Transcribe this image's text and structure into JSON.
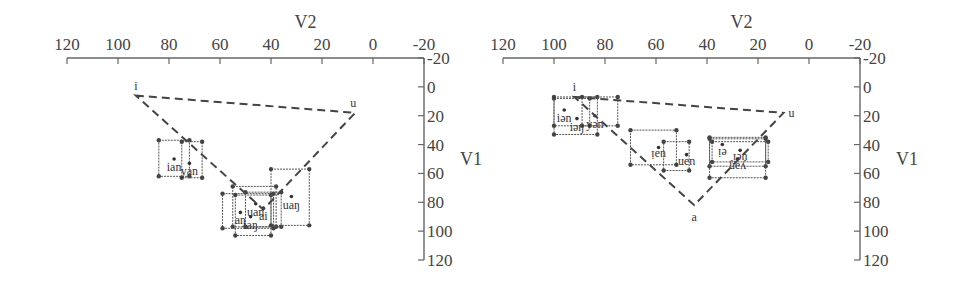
{
  "chart_data": [
    {
      "type": "scatter",
      "title": "",
      "xlabel": "V2",
      "ylabel": "V1",
      "xlim": [
        120,
        -20
      ],
      "ylim": [
        -20,
        120
      ],
      "x_ticks": [
        "120",
        "100",
        "80",
        "60",
        "40",
        "20",
        "0",
        "-20"
      ],
      "y_ticks": [
        "-20",
        "0",
        "20",
        "40",
        "60",
        "80",
        "100",
        "120"
      ],
      "grid": false,
      "triangle": {
        "points": [
          {
            "label": "i",
            "x": 93,
            "y": 6
          },
          {
            "label": "u",
            "x": 7,
            "y": 18
          },
          {
            "label": "",
            "x": 43,
            "y": 85
          }
        ]
      },
      "boxes": [
        {
          "label": "ian",
          "x": [
            84,
            72
          ],
          "y": [
            37,
            62
          ],
          "cx": 78,
          "cy": 50
        },
        {
          "label": "yan",
          "x": [
            75,
            67
          ],
          "y": [
            38,
            63
          ],
          "cx": 72,
          "cy": 53
        },
        {
          "label": "uan",
          "x": [
            55,
            38
          ],
          "y": [
            69,
            97
          ],
          "cx": 46,
          "cy": 81
        },
        {
          "label": "aŋ",
          "x": [
            59,
            39
          ],
          "y": [
            74,
            98
          ],
          "cx": 52,
          "cy": 87
        },
        {
          "label": "iaŋ",
          "x": [
            54,
            40
          ],
          "y": [
            75,
            103
          ],
          "cx": 48,
          "cy": 90
        },
        {
          "label": "ai",
          "x": [
            50,
            36
          ],
          "y": [
            73,
            97
          ],
          "cx": 43,
          "cy": 84
        },
        {
          "label": "uaŋ",
          "x": [
            40,
            25
          ],
          "y": [
            57,
            96
          ],
          "cx": 32,
          "cy": 76
        }
      ]
    },
    {
      "type": "scatter",
      "title": "",
      "xlabel": "V2",
      "ylabel": "V1",
      "xlim": [
        120,
        -20
      ],
      "ylim": [
        -20,
        120
      ],
      "x_ticks": [
        "120",
        "100",
        "80",
        "60",
        "40",
        "20",
        "0",
        "-20"
      ],
      "y_ticks": [
        "-20",
        "0",
        "20",
        "40",
        "60",
        "80",
        "100",
        "120"
      ],
      "grid": false,
      "triangle": {
        "points": [
          {
            "label": "i",
            "x": 92,
            "y": 7
          },
          {
            "label": "u",
            "x": 10,
            "y": 18
          },
          {
            "label": "a",
            "x": 45,
            "y": 82
          }
        ]
      },
      "boxes": [
        {
          "label": "iən",
          "x": [
            100,
            83
          ],
          "y": [
            7,
            33
          ],
          "cx": 96,
          "cy": 16
        },
        {
          "label": "iəŋ",
          "x": [
            100,
            86
          ],
          "y": [
            8,
            27
          ],
          "cx": 91,
          "cy": 22
        },
        {
          "label": "yən",
          "x": [
            89,
            75
          ],
          "y": [
            7,
            27
          ],
          "cx": 84,
          "cy": 20
        },
        {
          "label": "uəi",
          "x": [
            70,
            52
          ],
          "y": [
            30,
            54
          ],
          "cx": 59,
          "cy": 42
        },
        {
          "label": "uən",
          "x": [
            57,
            47
          ],
          "y": [
            38,
            58
          ],
          "cx": 48,
          "cy": 47
        },
        {
          "label": "ei",
          "x": [
            39,
            17
          ],
          "y": [
            35,
            55
          ],
          "cx": 34,
          "cy": 40
        },
        {
          "label": "uei",
          "x": [
            38,
            16
          ],
          "y": [
            38,
            52
          ],
          "cx": 27,
          "cy": 44
        },
        {
          "label": "yəŋ",
          "x": [
            39,
            17
          ],
          "y": [
            36,
            63
          ],
          "cx": 28,
          "cy": 50
        }
      ]
    }
  ],
  "plots": [
    {
      "xlabel": "V2",
      "ylabel": "V1"
    },
    {
      "xlabel": "V2",
      "ylabel": "V1"
    }
  ]
}
